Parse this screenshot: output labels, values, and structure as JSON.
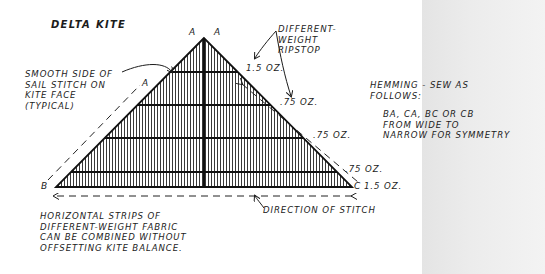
{
  "title": "DELTA KITE",
  "vertices": {
    "apex_left": "A",
    "apex_right": "A",
    "left_edge_marker": "A",
    "bottom_left": "B",
    "bottom_right": "C"
  },
  "annotations": {
    "smooth_side": [
      "SMOOTH SIDE OF",
      "SAIL STITCH ON",
      "KITE FACE",
      "(TYPICAL)"
    ],
    "ripstop": [
      "DIFFERENT-",
      "WEIGHT",
      "RIPSTOP"
    ],
    "hemming": [
      "HEMMING - SEW AS",
      "FOLLOWS:"
    ],
    "hemming_detail": [
      "BA, CA, BC OR CB",
      "FROM WIDE TO",
      "NARROW FOR SYMMETRY"
    ],
    "direction": "DIRECTION OF STITCH",
    "strips_note": [
      "HORIZONTAL STRIPS OF",
      "DIFFERENT-WEIGHT FABRIC",
      "CAN BE COMBINED WITHOUT",
      "OFFSETTING KITE BALANCE."
    ]
  },
  "fabric_weights": [
    {
      "label": "1.5 OZ.",
      "strip": 1
    },
    {
      "label": ".75 OZ.",
      "strip": 2
    },
    {
      "label": ".75 OZ.",
      "strip": 3
    },
    {
      "label": ".75 OZ.",
      "strip": 4
    },
    {
      "label": "1.5 OZ.",
      "strip": 5
    }
  ],
  "colors": {
    "ink": "#1c1c1c",
    "paper": "#ffffff",
    "gray_panel": "#e8e8e8"
  }
}
